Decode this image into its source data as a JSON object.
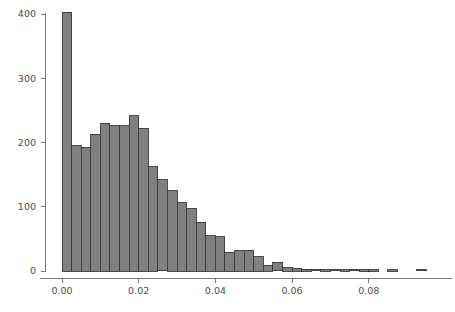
{
  "chart_data": {
    "type": "bar",
    "title": "",
    "subtitle": "",
    "xlabel": "",
    "ylabel": "",
    "xlim": [
      -0.0035,
      0.0975
    ],
    "ylim": [
      0,
      420
    ],
    "grid": false,
    "legend": null,
    "bin_width": 0.0025,
    "bar_color": "#808080",
    "bar_edge_color": "#3a3a3a",
    "axis_color": "#7a7a7a",
    "text_color": "#4d4d4d",
    "xticks": [
      0.0,
      0.02,
      0.04,
      0.06,
      0.08
    ],
    "xtick_labels": [
      "0.00",
      "0.02",
      "0.04",
      "0.06",
      "0.08"
    ],
    "yticks": [
      0,
      100,
      200,
      300,
      400
    ],
    "ytick_labels": [
      "0",
      "100",
      "200",
      "300",
      "400"
    ],
    "bin_edges": [
      0.0,
      0.0025,
      0.005,
      0.0075,
      0.01,
      0.0125,
      0.015,
      0.0175,
      0.02,
      0.0225,
      0.025,
      0.0275,
      0.03,
      0.0325,
      0.035,
      0.0375,
      0.04,
      0.0425,
      0.045,
      0.0475,
      0.05,
      0.0525,
      0.055,
      0.0575,
      0.06,
      0.0625,
      0.065,
      0.0675,
      0.07,
      0.0725,
      0.075,
      0.0775,
      0.08,
      0.0825,
      0.085,
      0.0875,
      0.09,
      0.0925,
      0.095
    ],
    "categories": [
      "0.0000",
      "0.0025",
      "0.0050",
      "0.0075",
      "0.0100",
      "0.0125",
      "0.0150",
      "0.0175",
      "0.0200",
      "0.0225",
      "0.0250",
      "0.0275",
      "0.0300",
      "0.0325",
      "0.0350",
      "0.0375",
      "0.0400",
      "0.0425",
      "0.0450",
      "0.0475",
      "0.0500",
      "0.0525",
      "0.0550",
      "0.0575",
      "0.0600",
      "0.0625",
      "0.0650",
      "0.0675",
      "0.0700",
      "0.0725",
      "0.0750",
      "0.0775",
      "0.0800",
      "0.0825",
      "0.0850",
      "0.0875",
      "0.0900",
      "0.0925"
    ],
    "values": [
      403,
      195,
      193,
      213,
      230,
      226,
      226,
      242,
      222,
      162,
      142,
      125,
      106,
      97,
      76,
      55,
      53,
      29,
      32,
      32,
      22,
      9,
      14,
      5,
      4,
      3,
      2,
      1,
      2,
      1,
      2,
      1,
      1,
      0,
      1,
      0,
      0,
      2
    ]
  }
}
